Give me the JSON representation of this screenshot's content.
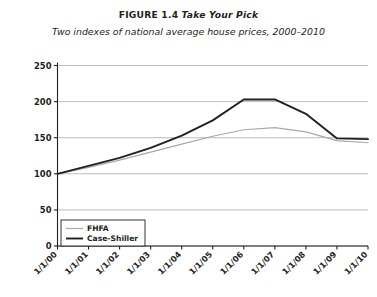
{
  "figure": {
    "label": "FIGURE 1.4",
    "name": "Take Your Pick",
    "subtitle": "Two indexes of national average house prices, 2000–2010"
  },
  "colors": {
    "case_shiller": "#231f20",
    "fhfa": "#a7a9ac",
    "grid": "#a7a9ac",
    "axis": "#231f20",
    "background": "#ffffff"
  },
  "chart_data": {
    "type": "line",
    "title": "FIGURE 1.4 Take Your Pick",
    "subtitle": "Two indexes of national average house prices, 2000–2010",
    "xlabel": "",
    "ylabel": "(January 2000 = 100)",
    "x": [
      "1/1/00",
      "1/1/01",
      "1/1/02",
      "1/1/03",
      "1/1/04",
      "1/1/05",
      "1/1/06",
      "1/1/07",
      "1/1/08",
      "1/1/09",
      "1/1/10"
    ],
    "xlim": [
      0,
      10
    ],
    "ylim": [
      0,
      250
    ],
    "yticks": [
      0,
      50,
      100,
      150,
      200,
      250
    ],
    "grid": "horizontal",
    "legend_position": "bottom-left",
    "series": [
      {
        "name": "FHFA",
        "color": "#a7a9ac",
        "values": [
          100,
          109,
          119,
          130,
          141,
          152,
          161,
          164,
          158,
          146,
          143
        ]
      },
      {
        "name": "Case-Shiller",
        "color": "#231f20",
        "values": [
          100,
          111,
          122,
          136,
          153,
          174,
          203,
          203,
          183,
          149,
          148
        ]
      }
    ]
  },
  "axis": {
    "y_label": "(January 2000 = 100)",
    "y_ticks": [
      "0",
      "50",
      "100",
      "150",
      "200",
      "250"
    ],
    "x_ticks": [
      "1/1/00",
      "1/1/01",
      "1/1/02",
      "1/1/03",
      "1/1/04",
      "1/1/05",
      "1/1/06",
      "1/1/07",
      "1/1/08",
      "1/1/09",
      "1/1/10"
    ]
  },
  "legend": {
    "items": [
      {
        "label": "FHFA"
      },
      {
        "label": "Case-Shiller"
      }
    ]
  }
}
